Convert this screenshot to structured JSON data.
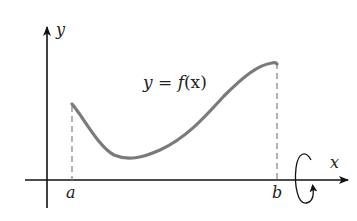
{
  "diagram": {
    "type": "solid-of-revolution-setup",
    "axes": {
      "x_label": "x",
      "y_label": "y"
    },
    "curve": {
      "label": "y = f(x)",
      "label_parts": {
        "lhs": "y",
        "eq": " = ",
        "fn": "f",
        "arg": "(x)"
      },
      "color": "#7a7a7a"
    },
    "bounds": {
      "left_label": "a",
      "right_label": "b"
    },
    "rotation": {
      "axis": "x",
      "indicator": "circular-arrow"
    },
    "colors": {
      "axis": "#111111",
      "dashed": "#8a8a8a",
      "text": "#222222"
    }
  }
}
